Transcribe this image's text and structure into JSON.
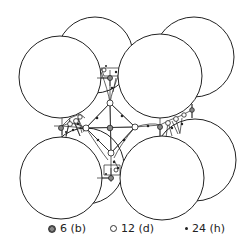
{
  "figure": {
    "colors": {
      "stroke": "#222222",
      "fill": "#ffffff",
      "b_site": "#777777",
      "h_site": "#222222"
    },
    "large_spheres": [
      {
        "name": "back-top-left",
        "cx": 95,
        "cy": 55,
        "r": 38
      },
      {
        "name": "back-top-right",
        "cx": 194,
        "cy": 57,
        "r": 40
      },
      {
        "name": "back-bottom-left",
        "cx": 86,
        "cy": 166,
        "r": 38
      },
      {
        "name": "back-bottom-right",
        "cx": 195,
        "cy": 160,
        "r": 41
      },
      {
        "name": "front-top-left",
        "cx": 60,
        "cy": 77,
        "r": 41
      },
      {
        "name": "front-top-right",
        "cx": 160,
        "cy": 76,
        "r": 42
      },
      {
        "name": "front-bottom-left",
        "cx": 61,
        "cy": 178,
        "r": 41
      },
      {
        "name": "front-bottom-right",
        "cx": 162,
        "cy": 178,
        "r": 42
      }
    ]
  },
  "legend": {
    "items": [
      {
        "symbol": "b",
        "label": "6 (b)"
      },
      {
        "symbol": "d",
        "label": "12 (d)"
      },
      {
        "symbol": "h",
        "label": "24 (h)"
      }
    ]
  }
}
